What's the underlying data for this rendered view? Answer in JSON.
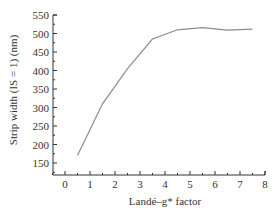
{
  "chart_data": {
    "type": "line",
    "title": "",
    "xlabel": "Landé–g* factor",
    "ylabel": "Strip width (IS = 1) (nm)",
    "xlim": [
      -0.5,
      8
    ],
    "ylim": [
      125,
      550
    ],
    "x_ticks": [
      0,
      1,
      2,
      3,
      4,
      5,
      6,
      7,
      8
    ],
    "y_ticks": [
      150,
      200,
      250,
      300,
      350,
      400,
      450,
      500,
      550
    ],
    "grid": false,
    "legend": null,
    "series": [
      {
        "name": "Strip width",
        "color": "#8c8c8c",
        "x": [
          0.5,
          1.5,
          2.5,
          3.5,
          4.5,
          5.5,
          6.5,
          7.5
        ],
        "values": [
          170,
          310,
          405,
          485,
          510,
          516,
          509,
          512
        ]
      }
    ]
  }
}
